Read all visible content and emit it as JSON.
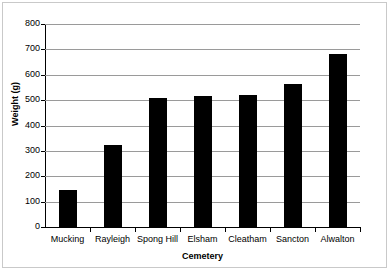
{
  "chart_data": {
    "type": "bar",
    "title": "",
    "xlabel": "Cemetery",
    "ylabel": "Weight (g)",
    "categories": [
      "Mucking",
      "Rayleigh",
      "Spong Hill",
      "Elsham",
      "Cleatham",
      "Sancton",
      "Alwalton"
    ],
    "values": [
      145,
      323,
      510,
      518,
      522,
      562,
      680
    ],
    "ylim": [
      0,
      800
    ],
    "ytick_step": 100,
    "yticks": [
      800,
      700,
      600,
      500,
      400,
      300,
      200,
      100,
      0
    ],
    "ytick_labels": [
      "800",
      "700",
      "600",
      "500",
      "400",
      "300",
      "200",
      "100",
      "0"
    ],
    "grid": "horizontal",
    "legend": "none",
    "bar_color": "#000000",
    "gridline_color": "#9a9a9a",
    "axis_color": "#000000",
    "background_color": "#ffffff",
    "border_color": "#c9c9c9"
  }
}
